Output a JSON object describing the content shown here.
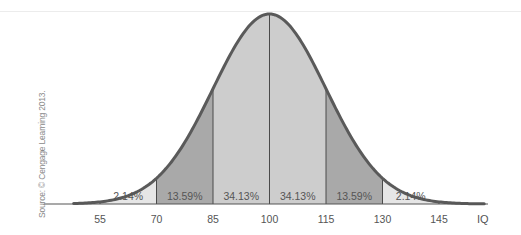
{
  "chart_data": {
    "type": "area",
    "title": "",
    "subtitle": "",
    "xlabel": "IQ",
    "ylabel": "",
    "distribution": "normal",
    "mean": 100,
    "sd": 15,
    "x_ticks": [
      55,
      70,
      85,
      100,
      115,
      130,
      145
    ],
    "x_range": [
      48,
      157
    ],
    "grid": false,
    "legend": null,
    "bands": [
      {
        "from": 55,
        "to": 70,
        "label": "2.14%",
        "value": 2.14,
        "fill": "#e6e6e6"
      },
      {
        "from": 70,
        "to": 85,
        "label": "13.59%",
        "value": 13.59,
        "fill": "#a9a9a9"
      },
      {
        "from": 85,
        "to": 100,
        "label": "34.13%",
        "value": 34.13,
        "fill": "#cdcdcd"
      },
      {
        "from": 100,
        "to": 115,
        "label": "34.13%",
        "value": 34.13,
        "fill": "#cdcdcd"
      },
      {
        "from": 115,
        "to": 130,
        "label": "13.59%",
        "value": 13.59,
        "fill": "#a9a9a9"
      },
      {
        "from": 130,
        "to": 145,
        "label": "2.14%",
        "value": 2.14,
        "fill": "#e6e6e6"
      }
    ],
    "annotations": [
      "Source: © Cengage Learning 2013."
    ]
  },
  "colors": {
    "curve": "#5a5a5a",
    "divider": "#4a4a4a",
    "axis": "#555555",
    "text": "#555555"
  },
  "source_note": "Source: © Cengage Learning 2013."
}
